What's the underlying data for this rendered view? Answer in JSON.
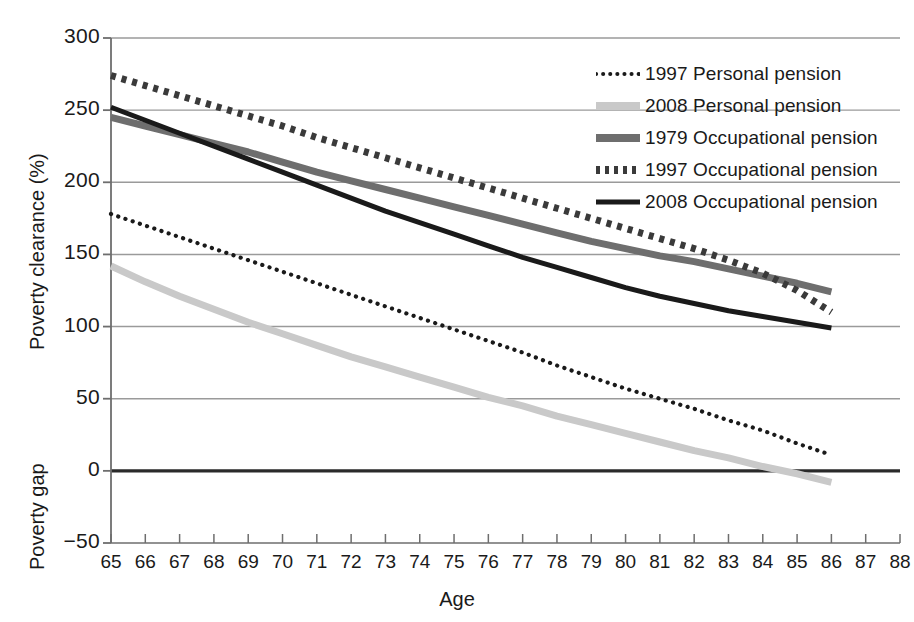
{
  "chart_data": {
    "type": "line",
    "title": "",
    "xlabel": "Age",
    "ylabel_upper": "Poverty clearance (%)",
    "ylabel_lower": "Poverty gap",
    "xlim": [
      65,
      88
    ],
    "ylim": [
      -50,
      300
    ],
    "xticks": [
      65,
      66,
      67,
      68,
      69,
      70,
      71,
      72,
      73,
      74,
      75,
      76,
      77,
      78,
      79,
      80,
      81,
      82,
      83,
      84,
      85,
      86,
      87,
      88
    ],
    "yticks": [
      -50,
      0,
      50,
      100,
      150,
      200,
      250,
      300
    ],
    "xtick_labels": [
      "65",
      "66",
      "67",
      "68",
      "69",
      "70",
      "71",
      "72",
      "73",
      "74",
      "75",
      "76",
      "77",
      "78",
      "79",
      "80",
      "81",
      "82",
      "83",
      "84",
      "85",
      "86",
      "87",
      "88"
    ],
    "ytick_labels": [
      "−50",
      "0",
      "50",
      "100",
      "150",
      "200",
      "250",
      "300"
    ],
    "grid": "horizontal",
    "zero_line_emphasis": true,
    "legend_position": "top-right",
    "x": [
      65,
      66,
      67,
      68,
      69,
      70,
      71,
      72,
      73,
      74,
      75,
      76,
      77,
      78,
      79,
      80,
      81,
      82,
      83,
      84,
      85,
      86
    ],
    "series": [
      {
        "name": "1997 Personal pension",
        "style": "dotted",
        "color": "#1a1a1a",
        "width": 3,
        "values": [
          178,
          170,
          162,
          154,
          146,
          138,
          130,
          122,
          114,
          106,
          98,
          90,
          82,
          73,
          65,
          57,
          50,
          43,
          35,
          28,
          19,
          11
        ]
      },
      {
        "name": "2008 Personal pension",
        "style": "solid",
        "color": "#c9c9c9",
        "width": 7,
        "values": [
          142,
          131,
          121,
          112,
          103,
          95,
          87,
          79,
          72,
          65,
          58,
          51,
          45,
          38,
          32,
          26,
          20,
          14,
          9,
          3,
          -2,
          -8
        ]
      },
      {
        "name": "1979 Occupational pension",
        "style": "solid",
        "color": "#6e6e6e",
        "width": 7,
        "values": [
          245,
          239,
          233,
          227,
          221,
          214,
          207,
          201,
          195,
          189,
          183,
          177,
          171,
          165,
          159,
          154,
          149,
          145,
          140,
          135,
          130,
          124
        ]
      },
      {
        "name": "1997 Occupational pension",
        "style": "dashed",
        "color": "#3a3a3a",
        "width": 7,
        "values": [
          274,
          267,
          260,
          253,
          246,
          239,
          231,
          224,
          217,
          210,
          203,
          196,
          189,
          182,
          175,
          168,
          161,
          154,
          146,
          137,
          125,
          110
        ]
      },
      {
        "name": "2008 Occupational pension",
        "style": "solid",
        "color": "#1a1a1a",
        "width": 5,
        "values": [
          252,
          243,
          234,
          225,
          216,
          207,
          198,
          189,
          180,
          172,
          164,
          156,
          148,
          141,
          134,
          127,
          121,
          116,
          111,
          107,
          103,
          99
        ]
      }
    ],
    "legend": [
      {
        "label": "1997 Personal pension",
        "style": "dotted",
        "color": "#1a1a1a"
      },
      {
        "label": "2008 Personal pension",
        "style": "solid",
        "color": "#c9c9c9"
      },
      {
        "label": "1979 Occupational pension",
        "style": "solid",
        "color": "#6e6e6e"
      },
      {
        "label": "1997 Occupational pension",
        "style": "dashed",
        "color": "#3a3a3a"
      },
      {
        "label": "2008 Occupational pension",
        "style": "solid",
        "color": "#1a1a1a"
      }
    ],
    "colors": {
      "grid": "#9a9a9a",
      "axis": "#6e6e6e",
      "zero_line": "#2a2a2a",
      "text": "#1a1a1a"
    }
  }
}
